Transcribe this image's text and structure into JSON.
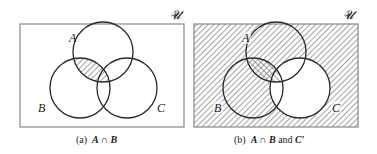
{
  "panels": [
    {
      "id": "a",
      "universe_label": "𝓤",
      "set_labels": {
        "A": "A",
        "B": "B",
        "C": "C"
      },
      "caption_prefix": "(a)",
      "caption_expr": "A ∩ B",
      "shaded": "A ∩ B"
    },
    {
      "id": "b",
      "universe_label": "𝓤",
      "set_labels": {
        "A": "A",
        "B": "B",
        "C": "C"
      },
      "caption_prefix": "(b)",
      "caption_expr": "A ∩ B",
      "caption_and": "and",
      "caption_expr2": "C′",
      "shaded": [
        "A ∩ B",
        "C′"
      ]
    }
  ],
  "colors": {
    "line": "#2a2a2a",
    "hatch": "#555555",
    "box": "#888888",
    "background": "#ffffff"
  }
}
